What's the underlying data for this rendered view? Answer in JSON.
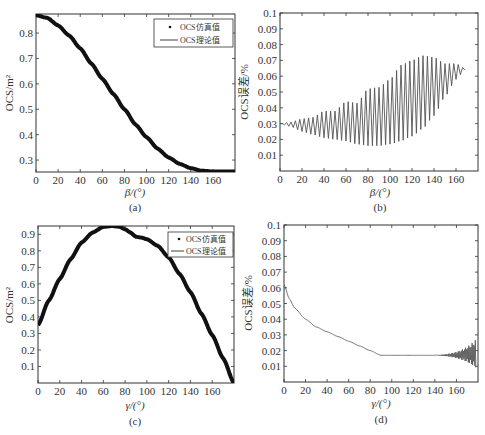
{
  "chart_data": [
    {
      "id": "a",
      "type": "line",
      "caption": "(a)",
      "xlabel": "β/(°)",
      "ylabel": "OCS/m²",
      "xlim": [
        0,
        180
      ],
      "ylim": [
        0.253,
        0.875
      ],
      "xticks": [
        0,
        20,
        40,
        60,
        80,
        100,
        120,
        140,
        160
      ],
      "yticks": [
        0.3,
        0.4,
        0.5,
        0.6,
        0.7,
        0.8
      ],
      "legend": {
        "position": "upper right",
        "entries": [
          "OCS仿真值",
          "OCS理论值"
        ]
      },
      "series": [
        {
          "name": "OCS仿真值",
          "style": "markers",
          "x": [
            0,
            10,
            20,
            30,
            40,
            50,
            60,
            70,
            80,
            90,
            100,
            110,
            120,
            130,
            140,
            150,
            160,
            170,
            180
          ],
          "y": [
            0.87,
            0.86,
            0.83,
            0.79,
            0.74,
            0.68,
            0.62,
            0.56,
            0.5,
            0.44,
            0.39,
            0.345,
            0.31,
            0.285,
            0.268,
            0.258,
            0.255,
            0.255,
            0.255
          ]
        },
        {
          "name": "OCS理论值",
          "style": "line",
          "x": [
            0,
            10,
            20,
            30,
            40,
            50,
            60,
            70,
            80,
            90,
            100,
            110,
            120,
            130,
            140,
            150,
            160,
            170,
            180
          ],
          "y": [
            0.87,
            0.86,
            0.83,
            0.79,
            0.74,
            0.68,
            0.62,
            0.56,
            0.5,
            0.44,
            0.39,
            0.345,
            0.31,
            0.285,
            0.268,
            0.258,
            0.255,
            0.255,
            0.255
          ]
        }
      ]
    },
    {
      "id": "b",
      "type": "line",
      "caption": "(b)",
      "xlabel": "β/(°)",
      "ylabel": "OCS误差/%",
      "xlim": [
        0,
        180
      ],
      "ylim": [
        0,
        0.1
      ],
      "xticks": [
        0,
        20,
        40,
        60,
        80,
        100,
        120,
        140,
        160
      ],
      "yticks": [
        0.01,
        0.02,
        0.03,
        0.04,
        0.05,
        0.06,
        0.07,
        0.08,
        0.09,
        0.1
      ],
      "series": [
        {
          "name": "upper envelope",
          "x": [
            0,
            10,
            20,
            30,
            40,
            50,
            60,
            70,
            80,
            90,
            100,
            110,
            120,
            130,
            140,
            150,
            160,
            168
          ],
          "y": [
            0.03,
            0.031,
            0.033,
            0.034,
            0.038,
            0.038,
            0.044,
            0.043,
            0.052,
            0.053,
            0.058,
            0.067,
            0.07,
            0.073,
            0.072,
            0.068,
            0.068,
            0.065
          ]
        },
        {
          "name": "lower envelope",
          "x": [
            0,
            10,
            20,
            30,
            40,
            50,
            60,
            70,
            80,
            90,
            100,
            110,
            120,
            130,
            140,
            150,
            160,
            168
          ],
          "y": [
            0.03,
            0.028,
            0.025,
            0.023,
            0.021,
            0.02,
            0.019,
            0.017,
            0.016,
            0.016,
            0.017,
            0.019,
            0.022,
            0.027,
            0.035,
            0.047,
            0.058,
            0.064
          ]
        }
      ],
      "oscillation_period_deg": 4
    },
    {
      "id": "c",
      "type": "line",
      "caption": "(c)",
      "xlabel": "γ/(°)",
      "ylabel": "OCS/m²",
      "xlim": [
        0,
        180
      ],
      "ylim": [
        0,
        0.95
      ],
      "xticks": [
        0,
        20,
        40,
        60,
        80,
        100,
        120,
        140,
        160
      ],
      "yticks": [
        0.1,
        0.2,
        0.3,
        0.4,
        0.5,
        0.6,
        0.7,
        0.8,
        0.9
      ],
      "legend": {
        "position": "upper right",
        "entries": [
          "OCS仿真值",
          "OCS理论值"
        ]
      },
      "series": [
        {
          "name": "OCS仿真值",
          "style": "markers",
          "x": [
            0,
            10,
            20,
            30,
            40,
            50,
            60,
            68,
            75,
            80,
            85,
            90,
            95,
            100,
            110,
            120,
            130,
            140,
            150,
            160,
            170,
            180
          ],
          "y": [
            0.35,
            0.5,
            0.63,
            0.75,
            0.85,
            0.91,
            0.945,
            0.95,
            0.945,
            0.93,
            0.91,
            0.885,
            0.88,
            0.87,
            0.83,
            0.76,
            0.66,
            0.55,
            0.42,
            0.29,
            0.15,
            0.0
          ]
        },
        {
          "name": "OCS理论值",
          "style": "line",
          "x": [
            0,
            10,
            20,
            30,
            40,
            50,
            60,
            68,
            75,
            80,
            85,
            90,
            95,
            100,
            110,
            120,
            130,
            140,
            150,
            160,
            170,
            180
          ],
          "y": [
            0.35,
            0.5,
            0.63,
            0.75,
            0.85,
            0.91,
            0.945,
            0.95,
            0.945,
            0.93,
            0.91,
            0.885,
            0.88,
            0.87,
            0.83,
            0.76,
            0.66,
            0.55,
            0.42,
            0.29,
            0.15,
            0.0
          ]
        }
      ]
    },
    {
      "id": "d",
      "type": "line",
      "caption": "(d)",
      "xlabel": "γ/(°)",
      "ylabel": "OCS误差/%",
      "xlim": [
        0,
        180
      ],
      "ylim": [
        0,
        0.1
      ],
      "xticks": [
        0,
        20,
        40,
        60,
        80,
        100,
        120,
        140,
        160
      ],
      "yticks": [
        0.01,
        0.02,
        0.03,
        0.04,
        0.05,
        0.06,
        0.07,
        0.08,
        0.09,
        0.1
      ],
      "series": [
        {
          "name": "OCS误差",
          "x": [
            0,
            5,
            10,
            20,
            30,
            40,
            50,
            60,
            70,
            80,
            90,
            100,
            120,
            140,
            160,
            170,
            175,
            178
          ],
          "y": [
            0.062,
            0.053,
            0.047,
            0.04,
            0.035,
            0.032,
            0.029,
            0.026,
            0.023,
            0.02,
            0.017,
            0.017,
            0.017,
            0.017,
            0.017,
            0.017,
            0.017,
            0.017
          ]
        }
      ],
      "noise_region": {
        "x_start": 120,
        "x_end": 178,
        "max_amplitude": 0.01
      }
    }
  ],
  "panels": {
    "a": {
      "caption": "(a)",
      "xlabel": "β/(°)",
      "ylabel": "OCS/m²",
      "legend_sim": "OCS仿真值",
      "legend_theory": "OCS理论值"
    },
    "b": {
      "caption": "(b)",
      "xlabel": "β/(°)",
      "ylabel": "OCS误差/%"
    },
    "c": {
      "caption": "(c)",
      "xlabel": "γ/(°)",
      "ylabel": "OCS/m²",
      "legend_sim": "OCS仿真值",
      "legend_theory": "OCS理论值"
    },
    "d": {
      "caption": "(d)",
      "xlabel": "γ/(°)",
      "ylabel": "OCS误差/%"
    }
  },
  "colors": {
    "curve": "#111111",
    "error_curve": "#555555",
    "axis": "#333333",
    "background": "#ffffff"
  }
}
